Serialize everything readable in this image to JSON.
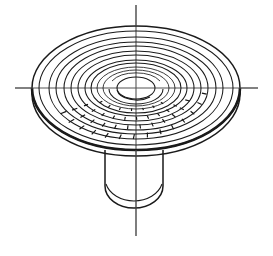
{
  "figure": {
    "caption": "",
    "background_color": "#ffffff",
    "ink_color": "#1a1a1a",
    "centerline_color": "#555555",
    "canvas": {
      "width": 273,
      "height": 256
    }
  },
  "geometry": {
    "center": {
      "cx": 136,
      "cy": 88
    },
    "vertical_centerline": {
      "x": 136,
      "y_top": 5,
      "y_bottom": 236
    },
    "horizontal_centerline": {
      "y": 88,
      "x_left": 15,
      "x_right": 258
    },
    "disc": {
      "outer_rim_rx": 104,
      "outer_rim_ry": 62,
      "rim_thickness": 9,
      "top_face_rx": 98,
      "top_face_ry": 58
    },
    "rings": [
      {
        "name": "ring-1-outer-groove",
        "rx": 86,
        "ry": 51,
        "hatched": true
      },
      {
        "name": "ring-2-groove",
        "rx": 78,
        "ry": 46,
        "hatched": true
      },
      {
        "name": "ring-3-groove",
        "rx": 67,
        "ry": 39,
        "hatched": true
      },
      {
        "name": "ring-4-groove",
        "rx": 58,
        "ry": 33,
        "hatched": true
      },
      {
        "name": "ring-5-inner",
        "rx": 45,
        "ry": 25,
        "hatched": false
      },
      {
        "name": "ring-6-inner",
        "rx": 33,
        "ry": 18,
        "hatched": false
      },
      {
        "name": "ring-7-core",
        "rx": 20,
        "ry": 11,
        "hatched": false
      }
    ],
    "stem": {
      "left_x": 105,
      "right_x": 163,
      "top_y": 150,
      "bottom_y": 208,
      "bottom_profile": "rounded"
    }
  },
  "labels": {
    "alt_text": "Engineering line drawing of a round mushroom-shaped disc viewed in isometric projection, showing multiple concentric grooved rings on its upper face and a short cylindrical shaft below, with vertical and horizontal centre lines crossing the part."
  }
}
